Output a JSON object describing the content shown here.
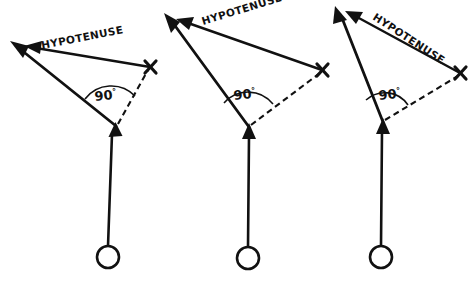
{
  "figure": {
    "background_color": "#ffffff",
    "ink_color": "#111111",
    "width": 472,
    "height": 284
  },
  "diagrams": [
    {
      "id": "diagram-1",
      "hypotenuse_label": "HYPOTENUSE",
      "hypotenuse_label_rotation": -11,
      "angle_label": "90",
      "angle_degree_symbol": "°",
      "x_marker_label": "X",
      "vertex": {
        "x": 116,
        "y": 126
      },
      "apex": {
        "x": 14,
        "y": 44
      },
      "x_point": {
        "x": 150,
        "y": 67
      },
      "bob_center": {
        "x": 108,
        "y": 257
      },
      "bob_radius": 11,
      "hyp_label_pos": {
        "x": 42,
        "y": 49
      },
      "angle_label_pos": {
        "x": 95,
        "y": 101
      },
      "arc_radius": 33
    },
    {
      "id": "diagram-2",
      "hypotenuse_label": "HYPOTENUSE",
      "hypotenuse_label_rotation": -17,
      "angle_label": "90",
      "angle_degree_symbol": "°",
      "x_marker_label": "X",
      "vertex": {
        "x": 249,
        "y": 127
      },
      "apex": {
        "x": 167,
        "y": 17
      },
      "x_point": {
        "x": 322,
        "y": 70
      },
      "bob_center": {
        "x": 248,
        "y": 258
      },
      "bob_radius": 11,
      "hyp_label_pos": {
        "x": 203,
        "y": 25
      },
      "angle_label_pos": {
        "x": 234,
        "y": 100
      },
      "arc_radius": 32
    },
    {
      "id": "diagram-3",
      "hypotenuse_label": "HYPOTENUSE",
      "hypotenuse_label_rotation": 33,
      "angle_label": "90",
      "angle_degree_symbol": "°",
      "x_marker_label": "X",
      "vertex": {
        "x": 383,
        "y": 122
      },
      "apex": {
        "x": 337,
        "y": 10
      },
      "x_point": {
        "x": 460,
        "y": 73
      },
      "bob_center": {
        "x": 381,
        "y": 257
      },
      "bob_radius": 11,
      "hyp_label_pos": {
        "x": 372,
        "y": 19
      },
      "angle_label_pos": {
        "x": 379,
        "y": 100
      },
      "arc_radius": 28
    }
  ]
}
